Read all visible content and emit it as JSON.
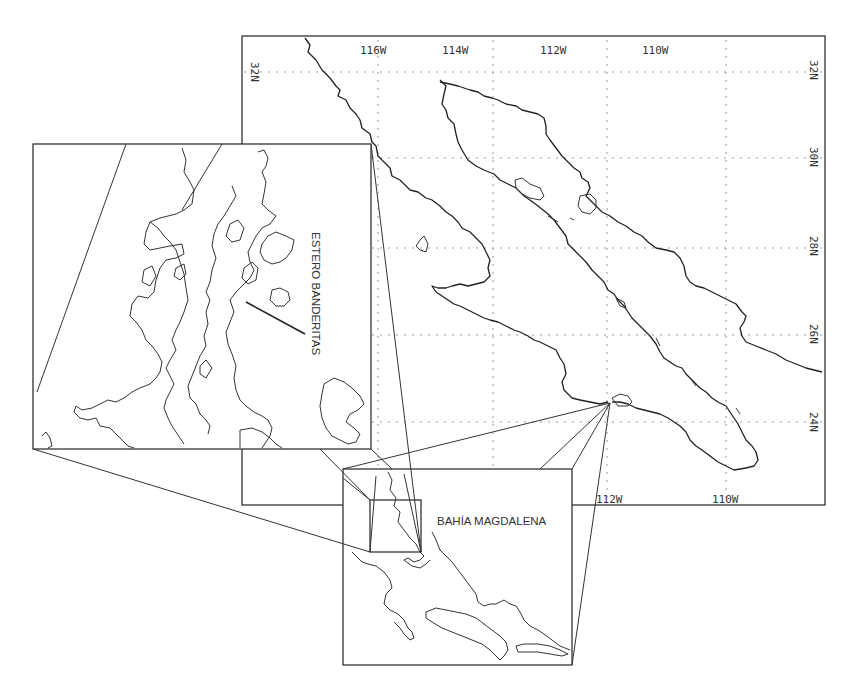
{
  "main_map": {
    "longitude_labels": [
      "116W",
      "114W",
      "112W",
      "110W"
    ],
    "longitude_labels_bottom": [
      "112W",
      "110W"
    ],
    "latitude_labels_left": [
      "32N"
    ],
    "latitude_labels_right": [
      "32N",
      "30N",
      "28N",
      "26N",
      "24N"
    ],
    "gridlines": {
      "longitudes_x": [
        378,
        493,
        607,
        726
      ],
      "latitudes_y": [
        72,
        158,
        248,
        335,
        422
      ]
    }
  },
  "inset_bay": {
    "label": "BAHÍA MAGDALENA"
  },
  "inset_detail": {
    "label": "ESTERO BANDERITAS"
  },
  "colors": {
    "line": "#222222",
    "grid": "#999999",
    "background": "#ffffff"
  }
}
